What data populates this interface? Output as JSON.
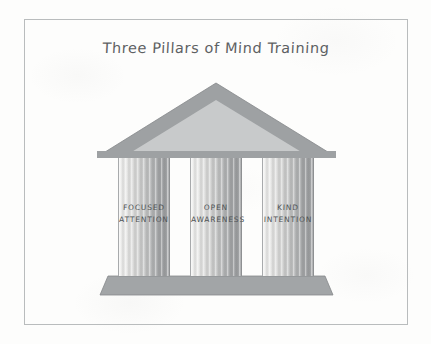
{
  "canvas": {
    "width": 431,
    "height": 344,
    "background_color": "#fdfdfc",
    "border_color": "#b9bcbd",
    "style": "hand-drawn sketch on paper"
  },
  "title": {
    "text": "Three Pillars of Mind Training",
    "color": "#5d6163"
  },
  "diagram": {
    "name": "greek-temple",
    "roof": {
      "label": "pediment",
      "outer_color": "#9ea1a3",
      "inner_color": "#c8cacb",
      "apex": {
        "x": 216,
        "y": 83
      },
      "left": {
        "x": 97,
        "y": 157
      },
      "right": {
        "x": 336,
        "y": 157
      }
    },
    "base": {
      "label": "stylobate",
      "color": "#a2a5a7",
      "top_left_x": 108,
      "top_right_x": 325,
      "bottom_left_x": 100,
      "bottom_right_x": 333,
      "top_y": 276,
      "bottom_y": 295
    },
    "pillars": [
      {
        "id": "pillar-1",
        "line1": "FOCUSED",
        "line2": "ATTENTION",
        "left": 118,
        "width": 52
      },
      {
        "id": "pillar-2",
        "line1": "OPEN",
        "line2": "AWARENESS",
        "left": 190,
        "width": 52
      },
      {
        "id": "pillar-3",
        "line1": "KIND",
        "line2": "INTENTION",
        "left": 262,
        "width": 52
      }
    ],
    "pillar_label_color": "#4e5254",
    "pillar_light_color": "#f2f2f1",
    "pillar_dark_color": "#9a9c9e"
  }
}
